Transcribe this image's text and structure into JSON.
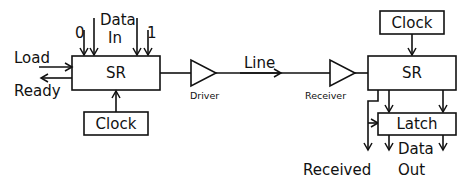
{
  "diagram": {
    "transmitter": {
      "shift_register": {
        "label": "SR"
      },
      "inputs": {
        "zero": "0",
        "data_in_line1": "Data",
        "data_in_line2": "In",
        "one": "1",
        "load": "Load"
      },
      "outputs": {
        "ready": "Ready"
      },
      "clock": {
        "label": "Clock"
      }
    },
    "driver": {
      "label": "Driver"
    },
    "line": {
      "label": "Line"
    },
    "receiver": {
      "label": "Receiver"
    },
    "receiving_end": {
      "clock": {
        "label": "Clock"
      },
      "shift_register": {
        "label": "SR"
      },
      "latch": {
        "label": "Latch"
      },
      "outputs": {
        "received": "Received",
        "data_out_line1": "Data",
        "data_out_line2": "Out"
      }
    }
  }
}
